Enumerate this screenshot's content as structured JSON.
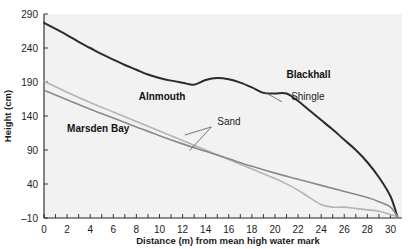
{
  "chart_data": {
    "type": "line",
    "title": "",
    "xlabel": "Distance (m) from mean high water mark",
    "ylabel": "Height (cm)",
    "xlim": [
      0,
      31
    ],
    "ylim": [
      -10,
      290
    ],
    "xticks": [
      0,
      1,
      2,
      3,
      4,
      5,
      6,
      7,
      8,
      9,
      10,
      11,
      12,
      13,
      14,
      15,
      16,
      17,
      18,
      19,
      20,
      21,
      22,
      23,
      24,
      25,
      26,
      27,
      28,
      29,
      30
    ],
    "xtick_labels": [
      "0",
      "",
      "2",
      "",
      "4",
      "",
      "6",
      "",
      "8",
      "",
      "10",
      "",
      "12",
      "",
      "14",
      "",
      "16",
      "",
      "18",
      "",
      "20",
      "",
      "22",
      "",
      "24",
      "",
      "26",
      "",
      "28",
      "",
      "30"
    ],
    "yticks": [
      -10,
      40,
      90,
      140,
      190,
      240,
      290
    ],
    "ytick_labels": [
      "–10",
      "40",
      "90",
      "140",
      "190",
      "240",
      "290"
    ],
    "grid": false,
    "legend_position": "inline-annotations",
    "series": [
      {
        "name": "Blackhall",
        "color": "#2b2b2b",
        "width": 2.0,
        "label_x": 21.0,
        "label_y": 196,
        "points": [
          [
            0,
            277
          ],
          [
            1,
            268
          ],
          [
            2,
            259
          ],
          [
            3,
            249
          ],
          [
            4,
            240
          ],
          [
            5,
            231
          ],
          [
            6,
            223
          ],
          [
            7,
            215
          ],
          [
            8,
            208
          ],
          [
            9,
            201
          ],
          [
            10,
            196
          ],
          [
            11,
            192
          ],
          [
            12,
            189
          ],
          [
            13,
            186
          ],
          [
            14,
            193
          ],
          [
            15,
            196
          ],
          [
            16,
            194
          ],
          [
            17,
            189
          ],
          [
            18,
            182
          ],
          [
            19,
            174
          ],
          [
            20,
            173
          ],
          [
            21,
            173
          ],
          [
            22,
            162
          ],
          [
            23,
            148
          ],
          [
            24,
            134
          ],
          [
            25,
            120
          ],
          [
            26,
            105
          ],
          [
            27,
            90
          ],
          [
            28,
            72
          ],
          [
            29,
            50
          ],
          [
            30,
            22
          ],
          [
            30.6,
            -8
          ]
        ]
      },
      {
        "name": "Alnmouth",
        "color": "#b4b4b4",
        "width": 1.6,
        "label_x": 8.2,
        "label_y": 163,
        "points": [
          [
            0,
            191
          ],
          [
            2,
            175
          ],
          [
            4,
            160
          ],
          [
            6,
            146
          ],
          [
            8,
            132
          ],
          [
            10,
            118
          ],
          [
            12,
            104
          ],
          [
            14,
            90
          ],
          [
            16,
            76
          ],
          [
            18,
            62
          ],
          [
            20,
            48
          ],
          [
            21,
            40
          ],
          [
            22,
            31
          ],
          [
            23,
            20
          ],
          [
            24,
            10
          ],
          [
            25,
            6
          ],
          [
            26,
            6
          ],
          [
            27,
            4
          ],
          [
            28,
            2
          ],
          [
            29,
            0
          ],
          [
            30.6,
            -8
          ]
        ]
      },
      {
        "name": "Marsden Bay",
        "color": "#8a8a8a",
        "width": 1.6,
        "label_x": 2.0,
        "label_y": 116,
        "points": [
          [
            0,
            178
          ],
          [
            2,
            164
          ],
          [
            4,
            150
          ],
          [
            6,
            137
          ],
          [
            8,
            124
          ],
          [
            10,
            111
          ],
          [
            12,
            99
          ],
          [
            14,
            88
          ],
          [
            16,
            77
          ],
          [
            18,
            66
          ],
          [
            20,
            56
          ],
          [
            22,
            47
          ],
          [
            24,
            38
          ],
          [
            26,
            29
          ],
          [
            28,
            20
          ],
          [
            29,
            14
          ],
          [
            30,
            6
          ],
          [
            30.6,
            -8
          ]
        ]
      }
    ],
    "annotations": [
      {
        "text": "Shingle",
        "text_x": 21.4,
        "text_y": 163,
        "leaders": [
          {
            "from_x": 20.6,
            "from_y": 161,
            "to_x": 19.1,
            "to_y": 175
          }
        ]
      },
      {
        "text": "Sand",
        "text_x": 15.0,
        "text_y": 127,
        "leaders": [
          {
            "from_x": 14.5,
            "from_y": 124,
            "to_x": 12.2,
            "to_y": 112
          },
          {
            "from_x": 14.5,
            "from_y": 124,
            "to_x": 12.6,
            "to_y": 89
          }
        ]
      }
    ]
  }
}
